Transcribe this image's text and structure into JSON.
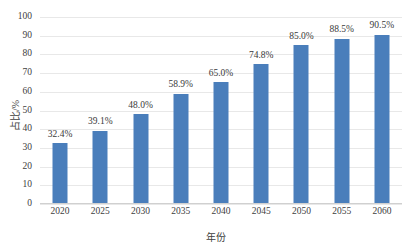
{
  "chart_data": {
    "type": "bar",
    "title": "",
    "xlabel": "年份",
    "ylabel": "占比/%",
    "categories": [
      "2020",
      "2025",
      "2030",
      "2035",
      "2040",
      "2045",
      "2050",
      "2055",
      "2060"
    ],
    "values": [
      32.4,
      39.1,
      48.0,
      58.9,
      65.0,
      74.8,
      85.0,
      88.5,
      90.5
    ],
    "data_labels": [
      "32.4%",
      "39.1%",
      "48.0%",
      "58.9%",
      "65.0%",
      "74.8%",
      "85.0%",
      "88.5%",
      "90.5%"
    ],
    "ylim": [
      0,
      100
    ],
    "ytick_labels": [
      "0",
      "10",
      "20",
      "30",
      "40",
      "50",
      "60",
      "70",
      "80",
      "90",
      "100"
    ],
    "ytick_values": [
      0,
      10,
      20,
      30,
      40,
      50,
      60,
      70,
      80,
      90,
      100
    ],
    "grid": true,
    "grid_axis": "y",
    "legend": false,
    "series": [
      {
        "name": "占比",
        "color": "#4A7EBB",
        "values": [
          32.4,
          39.1,
          48.0,
          58.9,
          65.0,
          74.8,
          85.0,
          88.5,
          90.5
        ]
      }
    ],
    "colors": {
      "bar": "#4A7EBB",
      "grid": "#e8e8e8",
      "axis": "#d0d0d0",
      "text": "#404040",
      "background": "#ffffff"
    }
  }
}
